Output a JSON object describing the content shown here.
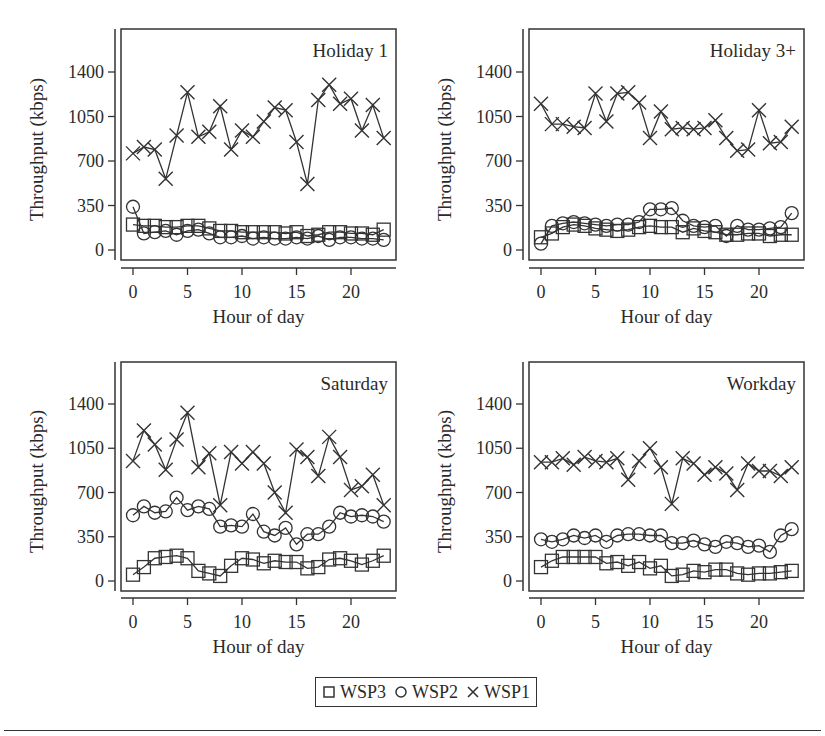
{
  "figure": {
    "legend": [
      {
        "label": "WSP3",
        "marker": "square-icon"
      },
      {
        "label": "WSP2",
        "marker": "circle-icon"
      },
      {
        "label": "WSP1",
        "marker": "x-icon"
      }
    ]
  },
  "chart_data": [
    {
      "type": "line",
      "title": "Holiday 1",
      "xlabel": "Hour of day",
      "ylabel": "Throughput (kbps)",
      "xticks": [
        0,
        5,
        10,
        15,
        20
      ],
      "yticks": [
        0,
        350,
        700,
        1050,
        1400
      ],
      "xlim": [
        0,
        23
      ],
      "ylim": [
        0,
        1400
      ],
      "grid": false,
      "x": [
        0,
        1,
        2,
        3,
        4,
        5,
        6,
        7,
        8,
        9,
        10,
        11,
        12,
        13,
        14,
        15,
        16,
        17,
        18,
        19,
        20,
        21,
        22,
        23
      ],
      "series": [
        {
          "name": "WSP1",
          "marker": "x",
          "values": [
            760,
            810,
            790,
            560,
            900,
            1240,
            890,
            930,
            1130,
            790,
            940,
            890,
            1010,
            1120,
            1100,
            850,
            520,
            1180,
            1300,
            1150,
            1190,
            940,
            1140,
            880
          ]
        },
        {
          "name": "WSP2",
          "marker": "o",
          "values": [
            340,
            130,
            140,
            150,
            120,
            150,
            160,
            130,
            100,
            100,
            110,
            90,
            100,
            90,
            90,
            100,
            90,
            110,
            80,
            100,
            100,
            90,
            90,
            80
          ]
        },
        {
          "name": "WSP3",
          "marker": "s",
          "values": [
            200,
            190,
            190,
            180,
            180,
            190,
            190,
            170,
            150,
            150,
            140,
            140,
            140,
            140,
            130,
            140,
            110,
            120,
            140,
            140,
            130,
            130,
            120,
            160
          ]
        }
      ]
    },
    {
      "type": "line",
      "title": "Holiday 3+",
      "xlabel": "Hour of day",
      "ylabel": "Throughput (kbps)",
      "xticks": [
        0,
        5,
        10,
        15,
        20
      ],
      "yticks": [
        0,
        350,
        700,
        1050,
        1400
      ],
      "xlim": [
        0,
        23
      ],
      "ylim": [
        0,
        1400
      ],
      "grid": false,
      "x": [
        0,
        1,
        2,
        3,
        4,
        5,
        6,
        7,
        8,
        9,
        10,
        11,
        12,
        13,
        14,
        15,
        16,
        17,
        18,
        19,
        20,
        21,
        22,
        23
      ],
      "series": [
        {
          "name": "WSP1",
          "marker": "x",
          "values": [
            1150,
            990,
            990,
            970,
            960,
            1230,
            1010,
            1230,
            1240,
            1160,
            880,
            1090,
            950,
            960,
            950,
            960,
            1020,
            880,
            780,
            790,
            1100,
            840,
            850,
            970
          ]
        },
        {
          "name": "WSP2",
          "marker": "o",
          "values": [
            50,
            190,
            210,
            220,
            210,
            200,
            190,
            200,
            200,
            220,
            320,
            320,
            330,
            230,
            190,
            180,
            190,
            110,
            190,
            160,
            160,
            170,
            180,
            290
          ]
        },
        {
          "name": "WSP3",
          "marker": "s",
          "values": [
            100,
            130,
            180,
            200,
            190,
            170,
            160,
            150,
            160,
            180,
            190,
            180,
            180,
            140,
            170,
            150,
            140,
            120,
            120,
            130,
            130,
            110,
            120,
            120
          ]
        }
      ]
    },
    {
      "type": "line",
      "title": "Saturday",
      "xlabel": "Hour of day",
      "ylabel": "Throughput (kbps)",
      "xticks": [
        0,
        5,
        10,
        15,
        20
      ],
      "yticks": [
        0,
        350,
        700,
        1050,
        1400
      ],
      "xlim": [
        0,
        23
      ],
      "ylim": [
        0,
        1400
      ],
      "grid": false,
      "x": [
        0,
        1,
        2,
        3,
        4,
        5,
        6,
        7,
        8,
        9,
        10,
        11,
        12,
        13,
        14,
        15,
        16,
        17,
        18,
        19,
        20,
        21,
        22,
        23
      ],
      "series": [
        {
          "name": "WSP1",
          "marker": "x",
          "values": [
            950,
            1190,
            1080,
            880,
            1120,
            1330,
            900,
            1010,
            600,
            1020,
            930,
            1020,
            930,
            700,
            540,
            1040,
            980,
            830,
            1140,
            980,
            720,
            750,
            840,
            600
          ]
        },
        {
          "name": "WSP2",
          "marker": "o",
          "values": [
            520,
            590,
            540,
            550,
            660,
            560,
            590,
            570,
            430,
            440,
            430,
            530,
            390,
            360,
            420,
            290,
            370,
            370,
            430,
            540,
            510,
            520,
            510,
            470
          ]
        },
        {
          "name": "WSP3",
          "marker": "s",
          "values": [
            50,
            110,
            180,
            190,
            200,
            180,
            80,
            60,
            40,
            120,
            180,
            170,
            140,
            160,
            150,
            150,
            100,
            110,
            170,
            180,
            160,
            130,
            160,
            200
          ]
        }
      ]
    },
    {
      "type": "line",
      "title": "Workday",
      "xlabel": "Hour of day",
      "ylabel": "Throughput (kbps)",
      "xticks": [
        0,
        5,
        10,
        15,
        20
      ],
      "yticks": [
        0,
        350,
        700,
        1050,
        1400
      ],
      "xlim": [
        0,
        23
      ],
      "ylim": [
        0,
        1400
      ],
      "grid": false,
      "x": [
        0,
        1,
        2,
        3,
        4,
        5,
        6,
        7,
        8,
        9,
        10,
        11,
        12,
        13,
        14,
        15,
        16,
        17,
        18,
        19,
        20,
        21,
        22,
        23
      ],
      "series": [
        {
          "name": "WSP1",
          "marker": "x",
          "values": [
            940,
            940,
            970,
            920,
            980,
            950,
            940,
            970,
            800,
            950,
            1050,
            900,
            610,
            970,
            930,
            840,
            900,
            850,
            720,
            930,
            870,
            870,
            830,
            900
          ]
        },
        {
          "name": "WSP2",
          "marker": "o",
          "values": [
            330,
            310,
            330,
            360,
            340,
            360,
            310,
            360,
            370,
            370,
            360,
            360,
            300,
            300,
            320,
            290,
            270,
            310,
            300,
            270,
            280,
            230,
            360,
            410
          ]
        },
        {
          "name": "WSP3",
          "marker": "s",
          "values": [
            110,
            160,
            190,
            190,
            190,
            190,
            140,
            150,
            120,
            150,
            100,
            120,
            40,
            50,
            80,
            70,
            90,
            90,
            60,
            50,
            60,
            60,
            70,
            80
          ]
        }
      ]
    }
  ]
}
